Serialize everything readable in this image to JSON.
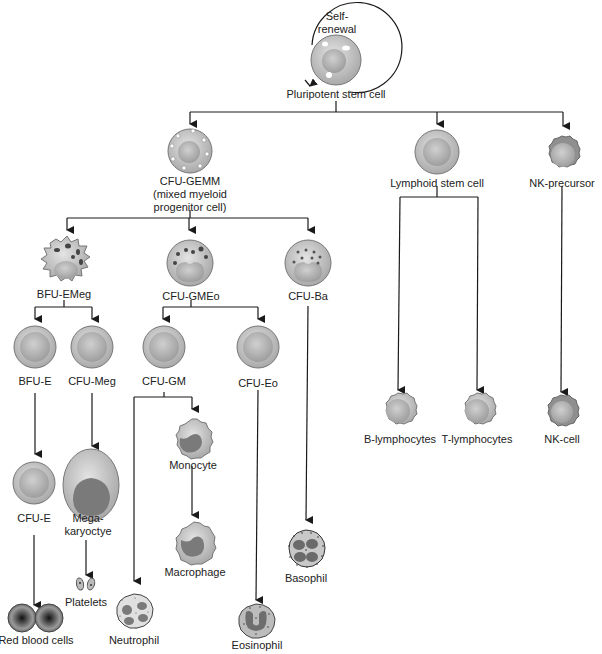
{
  "colors": {
    "line": "#1a1a1a",
    "cell_outer": "#b8b8b8",
    "cell_inner": "#d6d6d6",
    "nucleus": "#8a8a8a",
    "nucleus_dark": "#6a6a6a",
    "rbc_core": "#222222"
  },
  "nodes": {
    "self_renewal": {
      "label": "Self-\nrenewal"
    },
    "stem": {
      "label": "Pluripotent stem cell"
    },
    "cfu_gemm": {
      "label": "CFU-GEMM\n(mixed myeloid\nprogenitor cell)"
    },
    "lymphoid": {
      "label": "Lymphoid stem cell"
    },
    "nk_precursor": {
      "label": "NK-precursor"
    },
    "bfu_emeg": {
      "label": "BFU-EMeg"
    },
    "cfu_gmeo": {
      "label": "CFU-GMEo"
    },
    "cfu_ba": {
      "label": "CFU-Ba"
    },
    "bfu_e": {
      "label": "BFU-E"
    },
    "cfu_meg": {
      "label": "CFU-Meg"
    },
    "cfu_gm": {
      "label": "CFU-GM"
    },
    "cfu_eo": {
      "label": "CFU-Eo"
    },
    "cfu_e": {
      "label": "CFU-E"
    },
    "megakaryocyte": {
      "label": "Mega-\nkaryoctye"
    },
    "monocyte": {
      "label": "Monocyte"
    },
    "macrophage": {
      "label": "Macrophage"
    },
    "basophil": {
      "label": "Basophil"
    },
    "platelets": {
      "label": "Platelets"
    },
    "rbc": {
      "label": "Red blood cells"
    },
    "neutrophil": {
      "label": "Neutrophil"
    },
    "eosinophil": {
      "label": "Eosinophil"
    },
    "b_lymph": {
      "label": "B-lymphocytes"
    },
    "t_lymph": {
      "label": "T-lymphocytes"
    },
    "nk_cell": {
      "label": "NK-cell"
    }
  }
}
